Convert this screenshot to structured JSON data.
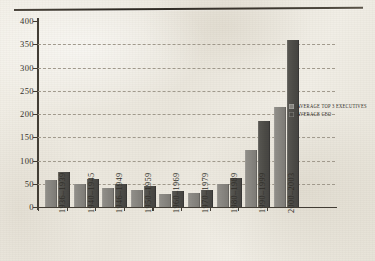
{
  "chart_data": {
    "type": "bar",
    "title": "",
    "xlabel": "",
    "ylabel": "",
    "ylim": [
      0,
      400
    ],
    "ytick_step": 50,
    "yticks": [
      "400",
      "350",
      "300",
      "250",
      "200",
      "150",
      "100",
      "50",
      "0"
    ],
    "ytick_values": [
      400,
      350,
      300,
      250,
      200,
      150,
      100,
      50,
      0
    ],
    "grid": "horizontal-dashed",
    "legend_position": "right-middle",
    "categories": [
      "1936–1939",
      "1940–1945",
      "1946–1949",
      "1950–1959",
      "1960–1969",
      "1970–1979",
      "1980–1989",
      "1990–1999",
      "2000–2003"
    ],
    "series": [
      {
        "name": "AVERAGE TOP 3 EXECUTIVES",
        "color": "#86847f",
        "values": [
          58,
          50,
          41,
          37,
          29,
          30,
          50,
          122,
          215
        ]
      },
      {
        "name": "AVERAGE CEO",
        "color": "#4b4a46",
        "values": [
          75,
          61,
          49,
          46,
          35,
          37,
          62,
          184,
          360
        ]
      }
    ]
  },
  "legend": {
    "items": [
      {
        "label": "AVERAGE TOP 3 EXECUTIVES"
      },
      {
        "label": "AVERAGE CEO"
      }
    ]
  },
  "colors": {
    "series_light": "#86847f",
    "series_dark": "#4b4a46",
    "axis": "#423d35",
    "gridline": "#9e978a",
    "paper": "#efece4"
  }
}
